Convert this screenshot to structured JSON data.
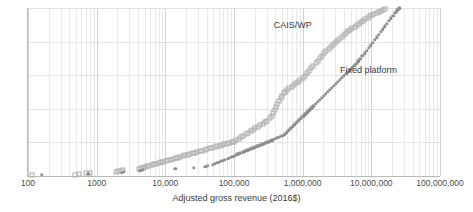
{
  "chart_data": {
    "type": "scatter",
    "title": "",
    "subtitle": "",
    "xlabel": "Adjusted gross revenue (2016$)",
    "ylabel": "",
    "xscale": "log",
    "xlim": [
      100,
      100000000
    ],
    "ylim": [
      0,
      1
    ],
    "grid": true,
    "legend_position": "inline-annotation",
    "xtick_labels": [
      "100",
      "1000",
      "10,000",
      "100,000",
      "1,000,000",
      "10,000,000",
      "100,000,000"
    ],
    "xtick_values": [
      100,
      1000,
      10000,
      100000,
      1000000,
      10000000,
      100000000
    ],
    "ytick_labels": [
      "0",
      "0.2",
      "0.4",
      "0.6",
      "0.8",
      "1"
    ],
    "ytick_values": [
      0,
      0.2,
      0.4,
      0.6,
      0.8,
      1
    ],
    "annotations": [
      {
        "text": "CAIS/WP",
        "x": 380000,
        "y": 0.93
      },
      {
        "text": "Fixed platform",
        "x": 3500000,
        "y": 0.66
      }
    ],
    "series": [
      {
        "name": "CAIS/WP",
        "marker": "open-square",
        "color": "#adadad",
        "points": [
          [
            115,
            0.004
          ],
          [
            480,
            0.008
          ],
          [
            560,
            0.012
          ],
          [
            700,
            0.016
          ],
          [
            790,
            0.02
          ],
          [
            1900,
            0.024
          ],
          [
            2050,
            0.028
          ],
          [
            2250,
            0.032
          ],
          [
            2400,
            0.036
          ],
          [
            4100,
            0.041
          ],
          [
            4400,
            0.045
          ],
          [
            4700,
            0.049
          ],
          [
            5000,
            0.053
          ],
          [
            5400,
            0.057
          ],
          [
            5800,
            0.061
          ],
          [
            6300,
            0.065
          ],
          [
            6800,
            0.069
          ],
          [
            7400,
            0.073
          ],
          [
            8000,
            0.077
          ],
          [
            8700,
            0.082
          ],
          [
            9400,
            0.086
          ],
          [
            10200,
            0.09
          ],
          [
            11100,
            0.094
          ],
          [
            12000,
            0.098
          ],
          [
            13000,
            0.102
          ],
          [
            14100,
            0.106
          ],
          [
            15300,
            0.11
          ],
          [
            16600,
            0.114
          ],
          [
            18000,
            0.119
          ],
          [
            19500,
            0.123
          ],
          [
            21200,
            0.127
          ],
          [
            23000,
            0.131
          ],
          [
            25000,
            0.135
          ],
          [
            27100,
            0.139
          ],
          [
            29400,
            0.143
          ],
          [
            31900,
            0.147
          ],
          [
            34600,
            0.151
          ],
          [
            37600,
            0.156
          ],
          [
            40800,
            0.16
          ],
          [
            44300,
            0.164
          ],
          [
            48100,
            0.168
          ],
          [
            52200,
            0.172
          ],
          [
            56700,
            0.176
          ],
          [
            61500,
            0.18
          ],
          [
            66800,
            0.184
          ],
          [
            72500,
            0.189
          ],
          [
            78700,
            0.193
          ],
          [
            85400,
            0.197
          ],
          [
            92700,
            0.201
          ],
          [
            100000,
            0.205
          ],
          [
            108000,
            0.213
          ],
          [
            117000,
            0.222
          ],
          [
            127000,
            0.231
          ],
          [
            137000,
            0.24
          ],
          [
            149000,
            0.249
          ],
          [
            161000,
            0.258
          ],
          [
            175000,
            0.267
          ],
          [
            189000,
            0.276
          ],
          [
            205000,
            0.285
          ],
          [
            222000,
            0.294
          ],
          [
            241000,
            0.303
          ],
          [
            261000,
            0.312
          ],
          [
            283000,
            0.321
          ],
          [
            307000,
            0.33
          ],
          [
            333000,
            0.343
          ],
          [
            352000,
            0.36
          ],
          [
            370000,
            0.377
          ],
          [
            389000,
            0.394
          ],
          [
            409000,
            0.411
          ],
          [
            430000,
            0.428
          ],
          [
            452000,
            0.445
          ],
          [
            476000,
            0.462
          ],
          [
            500000,
            0.479
          ],
          [
            526000,
            0.492
          ],
          [
            560000,
            0.502
          ],
          [
            600000,
            0.512
          ],
          [
            640000,
            0.522
          ],
          [
            690000,
            0.532
          ],
          [
            740000,
            0.542
          ],
          [
            800000,
            0.552
          ],
          [
            860000,
            0.562
          ],
          [
            925000,
            0.572
          ],
          [
            1000000,
            0.582
          ],
          [
            1070000,
            0.597
          ],
          [
            1150000,
            0.612
          ],
          [
            1240000,
            0.627
          ],
          [
            1330000,
            0.642
          ],
          [
            1430000,
            0.657
          ],
          [
            1540000,
            0.672
          ],
          [
            1650000,
            0.687
          ],
          [
            1780000,
            0.702
          ],
          [
            1910000,
            0.717
          ],
          [
            2060000,
            0.732
          ],
          [
            2210000,
            0.745
          ],
          [
            2380000,
            0.757
          ],
          [
            2560000,
            0.769
          ],
          [
            2750000,
            0.781
          ],
          [
            2960000,
            0.793
          ],
          [
            3180000,
            0.805
          ],
          [
            3420000,
            0.817
          ],
          [
            3680000,
            0.829
          ],
          [
            3960000,
            0.841
          ],
          [
            4260000,
            0.853
          ],
          [
            4580000,
            0.862
          ],
          [
            4930000,
            0.871
          ],
          [
            5300000,
            0.88
          ],
          [
            5700000,
            0.889
          ],
          [
            6130000,
            0.898
          ],
          [
            6600000,
            0.907
          ],
          [
            7100000,
            0.916
          ],
          [
            7640000,
            0.925
          ],
          [
            8220000,
            0.934
          ],
          [
            8840000,
            0.943
          ],
          [
            9510000,
            0.952
          ],
          [
            10200000,
            0.96
          ],
          [
            11000000,
            0.966
          ],
          [
            11900000,
            0.972
          ],
          [
            12800000,
            0.978
          ],
          [
            13800000,
            0.984
          ],
          [
            14800000,
            0.99
          ],
          [
            16000000,
            0.996
          ]
        ]
      },
      {
        "name": "Fixed platform",
        "marker": "filled-circle",
        "color": "#8f8f8f",
        "points": [
          [
            160,
            0.006
          ],
          [
            760,
            0.012
          ],
          [
            2300,
            0.018
          ],
          [
            2480,
            0.024
          ],
          [
            4300,
            0.03
          ],
          [
            4700,
            0.036
          ],
          [
            14000,
            0.042
          ],
          [
            26000,
            0.048
          ],
          [
            38000,
            0.055
          ],
          [
            41500,
            0.061
          ],
          [
            49000,
            0.067
          ],
          [
            53000,
            0.073
          ],
          [
            57500,
            0.079
          ],
          [
            62500,
            0.085
          ],
          [
            68000,
            0.091
          ],
          [
            74000,
            0.097
          ],
          [
            80500,
            0.103
          ],
          [
            87500,
            0.11
          ],
          [
            95000,
            0.116
          ],
          [
            103000,
            0.122
          ],
          [
            112000,
            0.128
          ],
          [
            122000,
            0.134
          ],
          [
            133000,
            0.14
          ],
          [
            144000,
            0.146
          ],
          [
            157000,
            0.152
          ],
          [
            170000,
            0.158
          ],
          [
            185000,
            0.164
          ],
          [
            201000,
            0.171
          ],
          [
            219000,
            0.177
          ],
          [
            238000,
            0.183
          ],
          [
            259000,
            0.189
          ],
          [
            281000,
            0.195
          ],
          [
            306000,
            0.201
          ],
          [
            332000,
            0.207
          ],
          [
            361000,
            0.213
          ],
          [
            392000,
            0.22
          ],
          [
            427000,
            0.226
          ],
          [
            464000,
            0.232
          ],
          [
            504000,
            0.238
          ],
          [
            548000,
            0.248
          ],
          [
            590000,
            0.26
          ],
          [
            630000,
            0.272
          ],
          [
            675000,
            0.284
          ],
          [
            722000,
            0.296
          ],
          [
            773000,
            0.308
          ],
          [
            828000,
            0.32
          ],
          [
            886000,
            0.332
          ],
          [
            949000,
            0.344
          ],
          [
            1020000,
            0.356
          ],
          [
            1090000,
            0.368
          ],
          [
            1170000,
            0.38
          ],
          [
            1250000,
            0.392
          ],
          [
            1340000,
            0.404
          ],
          [
            1430000,
            0.416
          ],
          [
            1540000,
            0.428
          ],
          [
            1650000,
            0.44
          ],
          [
            1760000,
            0.452
          ],
          [
            1890000,
            0.464
          ],
          [
            2020000,
            0.476
          ],
          [
            2170000,
            0.488
          ],
          [
            2320000,
            0.5
          ],
          [
            2480000,
            0.512
          ],
          [
            2660000,
            0.524
          ],
          [
            2850000,
            0.536
          ],
          [
            3050000,
            0.548
          ],
          [
            3270000,
            0.56
          ],
          [
            3500000,
            0.572
          ],
          [
            3750000,
            0.584
          ],
          [
            4010000,
            0.596
          ],
          [
            4300000,
            0.608
          ],
          [
            4600000,
            0.62
          ],
          [
            4930000,
            0.632
          ],
          [
            5280000,
            0.644
          ],
          [
            5650000,
            0.656
          ],
          [
            6050000,
            0.668
          ],
          [
            6480000,
            0.682
          ],
          [
            6940000,
            0.698
          ],
          [
            7430000,
            0.714
          ],
          [
            7960000,
            0.73
          ],
          [
            8520000,
            0.746
          ],
          [
            9120000,
            0.762
          ],
          [
            9770000,
            0.778
          ],
          [
            10500000,
            0.794
          ],
          [
            11200000,
            0.81
          ],
          [
            12000000,
            0.826
          ],
          [
            12900000,
            0.842
          ],
          [
            13800000,
            0.858
          ],
          [
            14800000,
            0.874
          ],
          [
            15800000,
            0.89
          ],
          [
            16900000,
            0.906
          ],
          [
            18100000,
            0.922
          ],
          [
            19400000,
            0.938
          ],
          [
            20800000,
            0.954
          ],
          [
            22200000,
            0.97
          ],
          [
            23800000,
            0.986
          ],
          [
            25500000,
            0.998
          ]
        ]
      }
    ]
  }
}
